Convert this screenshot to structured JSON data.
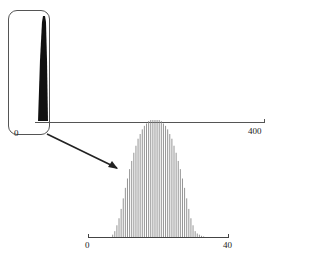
{
  "chart_data": [
    {
      "type": "bar",
      "title": "",
      "xlabel": "",
      "ylabel": "",
      "xlim": [
        0,
        400
      ],
      "tick_labels": [
        "0",
        "400"
      ],
      "description": "Full range: narrow tall spike near 0, highlighted by rounded box",
      "grid": false
    },
    {
      "type": "bar",
      "title": "",
      "xlabel": "",
      "ylabel": "",
      "xlim": [
        0,
        40
      ],
      "tick_labels": [
        "0",
        "40"
      ],
      "description": "Zoomed inset of the spike: bell-shaped bar distribution",
      "x": [
        7,
        7.6,
        8.2,
        8.8,
        9.4,
        10,
        10.6,
        11.2,
        11.8,
        12.4,
        13,
        13.6,
        14.2,
        14.8,
        15.4,
        16,
        16.6,
        17.2,
        17.8,
        18.4,
        19,
        19.6,
        20.2,
        20.8,
        21.4,
        22,
        22.6,
        23.2,
        23.8,
        24.4,
        25,
        25.6,
        26.2,
        26.8,
        27.4,
        28,
        28.6,
        29.2,
        29.8,
        30.4,
        31,
        31.6,
        32.2,
        32.8
      ],
      "values": [
        0.02,
        0.05,
        0.1,
        0.16,
        0.24,
        0.33,
        0.42,
        0.5,
        0.58,
        0.65,
        0.72,
        0.78,
        0.84,
        0.88,
        0.92,
        0.95,
        0.97,
        0.99,
        1.0,
        1.0,
        1.0,
        1.0,
        1.0,
        0.99,
        0.97,
        0.95,
        0.92,
        0.88,
        0.84,
        0.78,
        0.72,
        0.65,
        0.58,
        0.5,
        0.42,
        0.33,
        0.24,
        0.16,
        0.1,
        0.05,
        0.03,
        0.02,
        0.01,
        0.005
      ],
      "grid": false
    }
  ],
  "labels": {
    "main_zero": "0",
    "main_max": "400",
    "inset_zero": "0",
    "inset_max": "40"
  },
  "colors": {
    "spike": "#111111",
    "bars": "#888888",
    "axis": "#444444"
  }
}
